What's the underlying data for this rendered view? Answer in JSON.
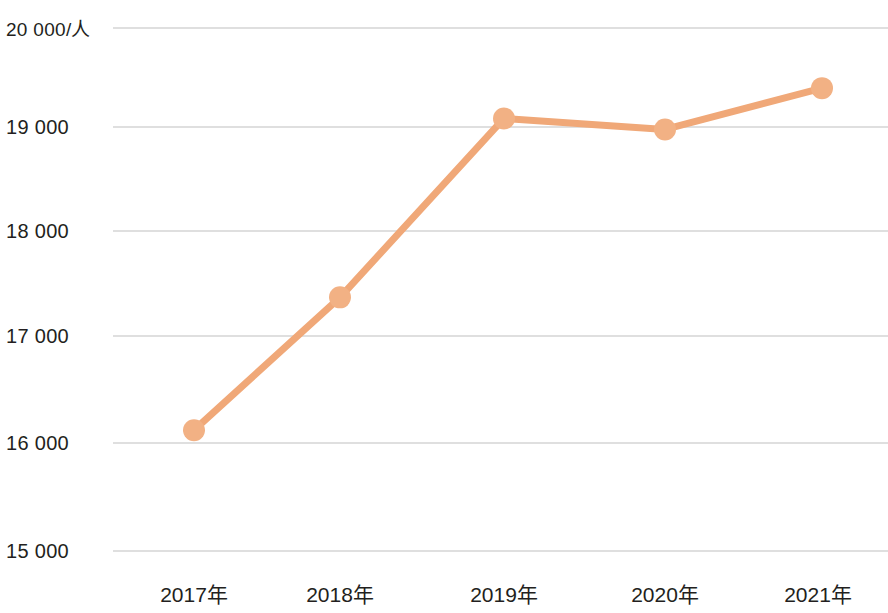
{
  "chart_data": {
    "type": "line",
    "title": "",
    "subtitle": "",
    "xlabel": "",
    "ylabel": "20 000/人",
    "unit_label": "/人",
    "categories": [
      "2017年",
      "2018年",
      "2019年",
      "2020年",
      "2021年"
    ],
    "series": [
      {
        "name": "人均值",
        "values": [
          16155,
          17425,
          19135,
          19030,
          19425
        ],
        "color": "#f0a878",
        "marker_color": "#f2b184",
        "marker_shape": "circle"
      }
    ],
    "ylim": [
      15000,
      20000
    ],
    "y_ticks": [
      15000,
      16000,
      17000,
      18000,
      19000,
      20000
    ],
    "y_tick_labels": [
      "15 000",
      "16 000",
      "17 000",
      "18 000",
      "19 000",
      "20 000/人"
    ],
    "x_tick_labels": [
      "2017年",
      "2018年",
      "2019年",
      "2020年",
      "2021年"
    ],
    "grid": {
      "horizontal": true,
      "vertical": false,
      "color": "#d5d5d5"
    },
    "legend": {
      "visible": false,
      "position": "none"
    },
    "axis": {
      "x_axis_line": false,
      "y_axis_line": false,
      "tick_marks": false
    },
    "background_color": "#ffffff",
    "text_color": "#231f20"
  },
  "axis_labels": {
    "y": [
      {
        "text": "20 000",
        "unit": "/人"
      },
      {
        "text": "19 000",
        "unit": ""
      },
      {
        "text": "18 000",
        "unit": ""
      },
      {
        "text": "17 000",
        "unit": ""
      },
      {
        "text": "16 000",
        "unit": ""
      },
      {
        "text": "15 000",
        "unit": ""
      }
    ],
    "x": [
      {
        "year": "2017",
        "unit": "年"
      },
      {
        "year": "2018",
        "unit": "年"
      },
      {
        "year": "2019",
        "unit": "年"
      },
      {
        "year": "2020",
        "unit": "年"
      },
      {
        "year": "2021",
        "unit": "年"
      }
    ]
  },
  "y_label_texts": {
    "t20000": "20 000/人",
    "t19000": "19 000",
    "t18000": "18 000",
    "t17000": "17 000",
    "t16000": "16 000",
    "t15000": "15 000"
  },
  "x_label_texts": {
    "y2017": "2017年",
    "y2018": "2018年",
    "y2019": "2019年",
    "y2020": "2020年",
    "y2021": "2021年"
  }
}
